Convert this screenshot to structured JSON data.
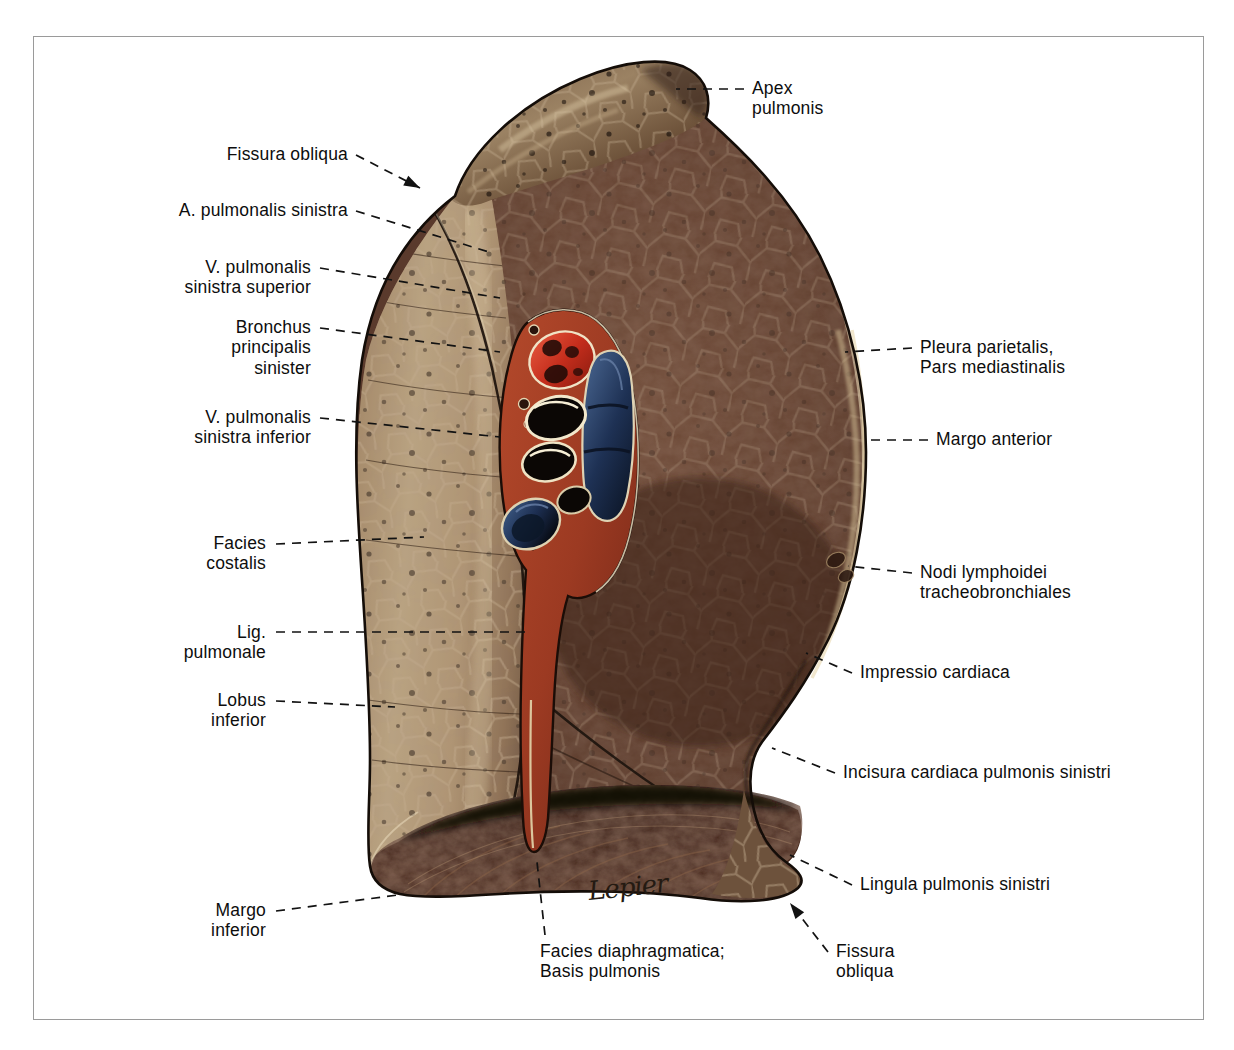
{
  "plate": {
    "title": "Pulmo sinister, facies mediastinalis",
    "signature": "Lepier",
    "frame_color": "#9a9a9a",
    "background": "#ffffff"
  },
  "colors": {
    "lung_costal_light": "#b9a184",
    "lung_costal_mid": "#8d6f55",
    "lung_mediastinal_dark": "#5a3a2c",
    "lung_outline": "#140d08",
    "diaphragmatic_shadow": "#2a1610",
    "artery_red": "#c42d1c",
    "vein_blue": "#1d2f52",
    "bronchus_dark": "#0b0705",
    "hilum_connective": "#9c3a22",
    "label_text": "#0d0d0d",
    "leader_line": "#121212"
  },
  "labels": {
    "left": [
      {
        "id": "fissura-obliqua-superior",
        "lines": [
          "Fissura obliqua"
        ],
        "x": 348,
        "y": 144,
        "anchor": "right",
        "leader": [
          [
            356,
            155
          ],
          [
            420,
            188
          ]
        ],
        "arrow": true
      },
      {
        "id": "a-pulmonalis-sinistra",
        "lines": [
          "A. pulmonalis sinistra"
        ],
        "x": 348,
        "y": 200,
        "anchor": "right",
        "leader": [
          [
            356,
            211
          ],
          [
            492,
            253
          ]
        ],
        "arrow": false
      },
      {
        "id": "v-pulmonalis-sinistra-superior",
        "lines": [
          "V. pulmonalis",
          "sinistra superior"
        ],
        "x": 311,
        "y": 257,
        "anchor": "right",
        "leader": [
          [
            320,
            268
          ],
          [
            500,
            298
          ]
        ],
        "arrow": false
      },
      {
        "id": "bronchus-principalis-sinister",
        "lines": [
          "Bronchus",
          "principalis",
          "sinister"
        ],
        "x": 311,
        "y": 317,
        "anchor": "right",
        "leader": [
          [
            320,
            328
          ],
          [
            500,
            352
          ]
        ],
        "arrow": false
      },
      {
        "id": "v-pulmonalis-sinistra-inferior",
        "lines": [
          "V. pulmonalis",
          "sinistra inferior"
        ],
        "x": 311,
        "y": 407,
        "anchor": "right",
        "leader": [
          [
            320,
            418
          ],
          [
            500,
            437
          ]
        ],
        "arrow": false
      },
      {
        "id": "facies-costalis",
        "lines": [
          "Facies",
          "costalis"
        ],
        "x": 266,
        "y": 533,
        "anchor": "right",
        "leader": [
          [
            276,
            544
          ],
          [
            424,
            537
          ]
        ],
        "arrow": false
      },
      {
        "id": "lig-pulmonale",
        "lines": [
          "Lig.",
          "pulmonale"
        ],
        "x": 266,
        "y": 622,
        "anchor": "right",
        "leader": [
          [
            276,
            632
          ],
          [
            527,
            632
          ]
        ],
        "arrow": false
      },
      {
        "id": "lobus-inferior",
        "lines": [
          "Lobus",
          "inferior"
        ],
        "x": 266,
        "y": 690,
        "anchor": "right",
        "leader": [
          [
            276,
            701
          ],
          [
            395,
            707
          ]
        ],
        "arrow": false
      },
      {
        "id": "margo-inferior",
        "lines": [
          "Margo",
          "inferior"
        ],
        "x": 266,
        "y": 900,
        "anchor": "right",
        "leader": [
          [
            276,
            911
          ],
          [
            398,
            895
          ]
        ],
        "arrow": false
      }
    ],
    "right": [
      {
        "id": "apex-pulmonis",
        "lines": [
          "Apex",
          "pulmonis"
        ],
        "x": 752,
        "y": 78,
        "anchor": "left",
        "leader": [
          [
            744,
            89
          ],
          [
            676,
            89
          ]
        ],
        "arrow": false
      },
      {
        "id": "pleura-parietalis",
        "lines": [
          "Pleura parietalis,",
          "Pars mediastinalis"
        ],
        "x": 920,
        "y": 337,
        "anchor": "left",
        "leader": [
          [
            912,
            348
          ],
          [
            845,
            352
          ]
        ],
        "arrow": false
      },
      {
        "id": "margo-anterior",
        "lines": [
          "Margo anterior"
        ],
        "x": 936,
        "y": 429,
        "anchor": "left",
        "leader": [
          [
            928,
            440
          ],
          [
            864,
            440
          ]
        ],
        "arrow": false
      },
      {
        "id": "nodi-lymphoidei",
        "lines": [
          "Nodi lymphoidei",
          "tracheobronchiales"
        ],
        "x": 920,
        "y": 562,
        "anchor": "left",
        "leader": [
          [
            912,
            573
          ],
          [
            848,
            566
          ]
        ],
        "arrow": false
      },
      {
        "id": "impressio-cardiaca",
        "lines": [
          "Impressio cardiaca"
        ],
        "x": 860,
        "y": 662,
        "anchor": "left",
        "leader": [
          [
            852,
            673
          ],
          [
            806,
            653
          ]
        ],
        "arrow": false
      },
      {
        "id": "incisura-cardiaca",
        "lines": [
          "Incisura cardiaca pulmonis sinistri"
        ],
        "x": 843,
        "y": 762,
        "anchor": "left",
        "leader": [
          [
            835,
            773
          ],
          [
            772,
            748
          ]
        ],
        "arrow": false
      },
      {
        "id": "lingula-pulmonis",
        "lines": [
          "Lingula pulmonis sinistri"
        ],
        "x": 860,
        "y": 874,
        "anchor": "left",
        "leader": [
          [
            852,
            885
          ],
          [
            790,
            855
          ]
        ],
        "arrow": false
      },
      {
        "id": "fissura-obliqua-inferior",
        "lines": [
          "Fissura",
          "obliqua"
        ],
        "x": 836,
        "y": 941,
        "anchor": "left",
        "leader": [
          [
            828,
            952
          ],
          [
            790,
            903
          ]
        ],
        "arrow": true
      }
    ],
    "bottom": [
      {
        "id": "facies-diaphragmatica",
        "lines": [
          "Facies diaphragmatica;",
          "Basis pulmonis"
        ],
        "x": 540,
        "y": 941,
        "anchor": "left",
        "leader": [
          [
            545,
            935
          ],
          [
            537,
            862
          ]
        ],
        "arrow": false
      }
    ]
  }
}
